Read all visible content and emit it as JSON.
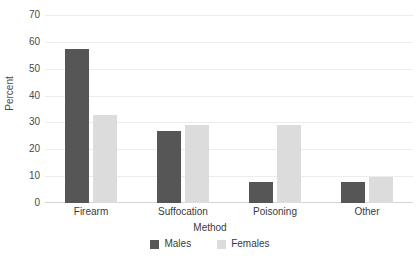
{
  "chart_data": {
    "type": "bar",
    "title": "",
    "xlabel": "Method",
    "ylabel": "Percent",
    "categories": [
      "Firearm",
      "Suffocation",
      "Poisoning",
      "Other"
    ],
    "series": [
      {
        "name": "Males",
        "color": "#565656",
        "values": [
          57.5,
          26.8,
          8.0,
          7.8
        ]
      },
      {
        "name": "Females",
        "color": "#dcdcdc",
        "values": [
          32.8,
          28.9,
          28.9,
          9.7
        ]
      }
    ],
    "ylim": [
      0,
      70
    ],
    "yticks": [
      0,
      10,
      20,
      30,
      40,
      50,
      60,
      70
    ],
    "ytick_labels": [
      "0",
      "10",
      "20",
      "30",
      "40",
      "50",
      "60",
      "70"
    ],
    "grid": true,
    "legend_position": "bottom"
  },
  "legend": {
    "items": [
      {
        "label": "Males",
        "color": "#565656"
      },
      {
        "label": "Females",
        "color": "#dcdcdc"
      }
    ]
  }
}
